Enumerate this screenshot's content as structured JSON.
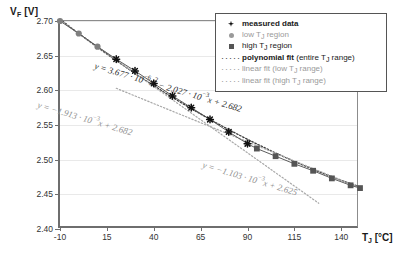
{
  "chart_data": {
    "type": "scatter",
    "title": "",
    "xlabel": "T_J [°C]",
    "ylabel": "V_F [V]",
    "xlim": [
      -10,
      150
    ],
    "ylim": [
      2.4,
      2.7
    ],
    "xticks": [
      "-10",
      "15",
      "40",
      "65",
      "90",
      "115",
      "140"
    ],
    "xtick_values": [
      -10,
      15,
      40,
      65,
      90,
      115,
      140
    ],
    "yticks": [
      "2.70",
      "2.65",
      "2.60",
      "2.55",
      "2.50",
      "2.45",
      "2.40"
    ],
    "ytick_values": [
      2.7,
      2.65,
      2.6,
      2.55,
      2.5,
      2.45,
      2.4
    ],
    "grid": true,
    "legend_position": "top-right",
    "series": [
      {
        "name": "low T_J region",
        "marker": "circle",
        "x": [
          -10,
          0,
          10
        ],
        "y": [
          2.7,
          2.682,
          2.663
        ]
      },
      {
        "name": "measured data",
        "marker": "star",
        "x": [
          20,
          30,
          40,
          50,
          60,
          70,
          80,
          90
        ],
        "y": [
          2.645,
          2.628,
          2.61,
          2.592,
          2.575,
          2.558,
          2.54,
          2.523
        ]
      },
      {
        "name": "high T_J region",
        "marker": "square",
        "x": [
          95,
          105,
          115,
          125,
          135,
          145,
          150
        ],
        "y": [
          2.516,
          2.505,
          2.494,
          2.484,
          2.473,
          2.463,
          2.459
        ]
      }
    ],
    "fits": [
      {
        "name": "polynomial fit (entire T_J range)",
        "style": "dotted-dark",
        "equation": "y = 3.677 · 10^-6 x^2 - 2.027 · 10^-3 x + 2.682",
        "a": 3.677e-06,
        "b": -0.002027,
        "c": 2.682
      },
      {
        "name": "linear fit (low T_J range)",
        "style": "dotted-grey",
        "equation": "y = -1.913 · 10^-3 x + 2.682",
        "m": -0.001913,
        "b": 2.682
      },
      {
        "name": "linear fit (high T_J range)",
        "style": "dotted-grey",
        "equation": "y = -1.103 · 10^-3 x + 2.625",
        "m": -0.001103,
        "b": 2.625
      }
    ]
  },
  "axes": {
    "y_title_main": "V",
    "y_title_sub": "F",
    "y_title_unit": " [V]",
    "x_title_main": "T",
    "x_title_sub": "J",
    "x_title_unit": " [°C]"
  },
  "legend": {
    "items": [
      {
        "key": "star-marker",
        "label_bold": "measured data",
        "label_rest": "",
        "grey": false
      },
      {
        "key": "circle-marker",
        "label_bold": "",
        "label_rest": "low T_J region",
        "grey": true
      },
      {
        "key": "square-marker",
        "label_bold": "",
        "label_rest": "high T_J region",
        "grey": false
      },
      {
        "key": "dotted-dark",
        "label_bold": "polynomial fit",
        "label_rest": " (entire T_J range)",
        "grey": false
      },
      {
        "key": "dotted-grey",
        "label_bold": "",
        "label_rest": "linear fit (low T_J range)",
        "grey": true
      },
      {
        "key": "dotted-grey",
        "label_bold": "",
        "label_rest": "linear fit (high T_J range)",
        "grey": true
      }
    ]
  },
  "equations": {
    "poly": "y = 3.677 · 10⁻⁶x² - 2.027 · 10⁻³x + 2.682",
    "low": "y = -1.913 · 10⁻³x + 2.682",
    "high": "y = -1.103 · 10⁻³x + 2.625"
  }
}
